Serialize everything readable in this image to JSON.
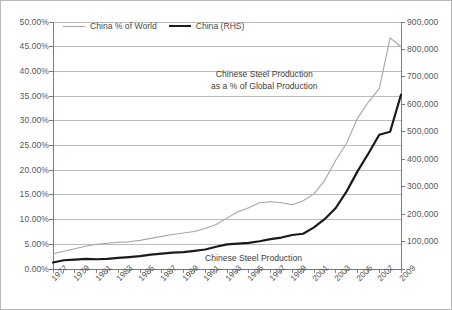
{
  "chart_data": {
    "type": "line",
    "title": "",
    "xlabel": "",
    "ylabel": "",
    "grid": true,
    "legend_position": "top-left",
    "x": [
      1977,
      1978,
      1979,
      1980,
      1981,
      1982,
      1983,
      1984,
      1985,
      1986,
      1987,
      1988,
      1989,
      1990,
      1991,
      1992,
      1993,
      1994,
      1995,
      1996,
      1997,
      1998,
      1999,
      2000,
      2001,
      2002,
      2003,
      2004,
      2005,
      2006,
      2007,
      2008,
      2009
    ],
    "x_tick_labels": [
      "1977",
      "1979",
      "1981",
      "1983",
      "1985",
      "1987",
      "1989",
      "1991",
      "1993",
      "1995",
      "1997",
      "1999",
      "2001",
      "2003",
      "2005",
      "2007",
      "2009"
    ],
    "left_axis": {
      "label": "",
      "ylim": [
        0,
        50
      ],
      "unit": "%",
      "tick_labels": [
        "0.00%",
        "5.00%",
        "10.00%",
        "15.00%",
        "20.00%",
        "25.00%",
        "30.00%",
        "35.00%",
        "40.00%",
        "45.00%",
        "50.00%"
      ],
      "tick_values": [
        0,
        5,
        10,
        15,
        20,
        25,
        30,
        35,
        40,
        45,
        50
      ]
    },
    "right_axis": {
      "label": "",
      "ylim": [
        0,
        900000
      ],
      "unit": "thousand metric tons",
      "tick_labels": [
        "-",
        "100,000",
        "200,000",
        "300,000",
        "400,000",
        "500,000",
        "600,000",
        "700,000",
        "800,000",
        "900,000"
      ],
      "tick_values": [
        0,
        100000,
        200000,
        300000,
        400000,
        500000,
        600000,
        700000,
        800000,
        900000
      ]
    },
    "series": [
      {
        "name": "China % of World",
        "axis": "left",
        "color": "#a6a6a6",
        "width": 1.1,
        "values": [
          3.1,
          3.6,
          4.1,
          4.6,
          5.0,
          5.2,
          5.4,
          5.5,
          5.8,
          6.2,
          6.6,
          7.0,
          7.3,
          7.6,
          8.2,
          9.0,
          10.3,
          11.6,
          12.4,
          13.4,
          13.6,
          13.4,
          13.0,
          13.8,
          15.2,
          18.0,
          22.0,
          25.5,
          30.5,
          33.8,
          36.5,
          46.8,
          45.0
        ]
      },
      {
        "name": "China (RHS)",
        "axis": "right",
        "color": "#1a1a1a",
        "width": 2.2,
        "values": [
          23700,
          31800,
          34500,
          37100,
          35600,
          37200,
          40200,
          43400,
          46800,
          52200,
          56300,
          59400,
          61600,
          66300,
          71000,
          80900,
          89500,
          92600,
          95400,
          101200,
          108900,
          114600,
          124000,
          128500,
          151600,
          182400,
          222300,
          282900,
          355800,
          421000,
          489000,
          500300,
          635000
        ]
      }
    ],
    "annotations": [
      {
        "id": "pct",
        "line1": "Chinese Steel Production",
        "line2": "as a % of Global Production"
      },
      {
        "id": "prod",
        "text": "Chinese Steel Production"
      }
    ]
  },
  "legend": {
    "items": [
      {
        "label": "China % of World",
        "style": "light"
      },
      {
        "label": "China (RHS)",
        "style": "dark"
      }
    ]
  },
  "colors": {
    "series_light": "#a6a6a6",
    "series_dark": "#1a1a1a",
    "grid": "#9e9e9e",
    "axis": "#6e6e6e",
    "text": "#585858",
    "border": "#b9b9b9",
    "background": "#ffffff"
  }
}
